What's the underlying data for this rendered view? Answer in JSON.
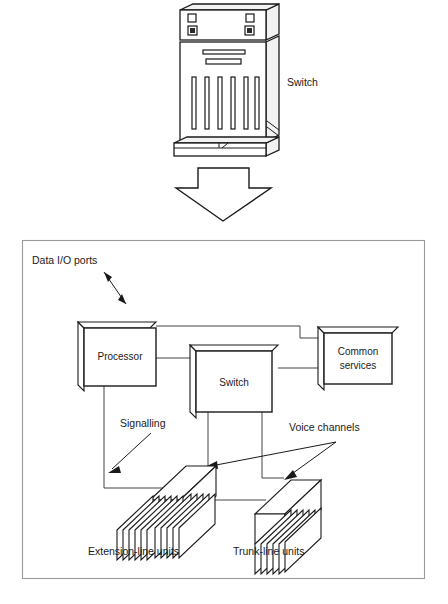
{
  "figure": {
    "cabinet": {
      "label": "Switch",
      "icon": "switch-cabinet-icon",
      "vent_slot_count": 6,
      "indicator_squares": 4
    },
    "transition_arrow": {
      "icon": "down-block-arrow-icon",
      "direction": "down"
    },
    "panel": {
      "blocks": [
        {
          "id": "processor",
          "label": "Processor"
        },
        {
          "id": "switch",
          "label": "Switch"
        },
        {
          "id": "common-services",
          "label": "Common\nservices",
          "line1": "Common",
          "line2": "services"
        }
      ],
      "annotations": [
        {
          "id": "data-io-ports",
          "label": "Data I/O ports",
          "arrow": "double-headed"
        },
        {
          "id": "signalling",
          "label": "Signalling",
          "arrow": "single-headed"
        },
        {
          "id": "voice-channels",
          "label": "Voice channels",
          "arrow": "double-branch"
        }
      ],
      "units": [
        {
          "id": "extension-line-units",
          "label": "Extension-line units",
          "card_count": 12
        },
        {
          "id": "trunk-line-units",
          "label": "Trunk-line units",
          "card_count": 6
        }
      ]
    },
    "colors": {
      "ink": "#1a1a1a",
      "panel_border": "#9a9a9a",
      "cabinet_side": "#f2f2f2",
      "indicator_fill": "#2b2b2b",
      "background": "#ffffff"
    }
  }
}
